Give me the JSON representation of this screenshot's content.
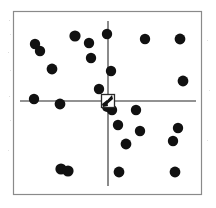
{
  "figure": {
    "title": "",
    "watermark_text": "",
    "background_color": "#ffffff",
    "frame": {
      "x": 13.5,
      "y": 11.5,
      "width": 188,
      "height": 183,
      "stroke_color": "#8a8a8a",
      "stroke_width": 1.2
    },
    "speckle_color": "#d8d8d8"
  },
  "chart_data": {
    "type": "scatter",
    "title": "",
    "subtitle": "",
    "xlabel": "",
    "ylabel": "",
    "xlim": [
      13.5,
      201.5
    ],
    "ylim": [
      11.5,
      194.5
    ],
    "grid": false,
    "legend": null,
    "legend_position": "none",
    "marker_shape": "circle",
    "marker_color": "#111111",
    "marker_radius": 5.0,
    "axes_style": {
      "type": "crosshair",
      "stroke_color": "#6e6e6e",
      "stroke_width": 1.6,
      "origin_x": 108,
      "origin_y": 101,
      "vertical_axis": {
        "x": 108,
        "y_start": 21,
        "y_end": 186
      },
      "horizontal_axis": {
        "y": 101,
        "x_start": 20,
        "x_end": 196
      }
    },
    "origin_marker": {
      "shape": "square-outline-with-blot",
      "x": 108,
      "y": 101,
      "size": 13,
      "stroke_color": "#2a2a2a",
      "stroke_width": 1.3,
      "blot_color": "#111111",
      "label": "origin"
    },
    "points": [
      {
        "x": 35,
        "y": 44,
        "r": 5.2,
        "quadrant": "upper-left"
      },
      {
        "x": 40,
        "y": 51,
        "r": 5.2,
        "quadrant": "upper-left"
      },
      {
        "x": 52,
        "y": 69,
        "r": 5.4,
        "quadrant": "upper-left"
      },
      {
        "x": 75,
        "y": 36,
        "r": 5.6,
        "quadrant": "upper-left"
      },
      {
        "x": 89,
        "y": 43,
        "r": 5.2,
        "quadrant": "upper-left"
      },
      {
        "x": 91,
        "y": 58,
        "r": 5.2,
        "quadrant": "upper-left"
      },
      {
        "x": 34,
        "y": 99,
        "r": 5.2,
        "quadrant": "upper-left"
      },
      {
        "x": 60,
        "y": 104,
        "r": 5.4,
        "quadrant": "lower-left"
      },
      {
        "x": 107,
        "y": 34,
        "r": 5.2,
        "quadrant": "upper-right"
      },
      {
        "x": 111,
        "y": 71,
        "r": 5.2,
        "quadrant": "upper-right"
      },
      {
        "x": 145,
        "y": 39,
        "r": 5.2,
        "quadrant": "upper-right"
      },
      {
        "x": 180,
        "y": 39,
        "r": 5.4,
        "quadrant": "upper-right"
      },
      {
        "x": 183,
        "y": 81,
        "r": 5.4,
        "quadrant": "upper-right"
      },
      {
        "x": 61,
        "y": 169,
        "r": 5.6,
        "quadrant": "lower-left"
      },
      {
        "x": 68,
        "y": 171,
        "r": 5.6,
        "quadrant": "lower-left"
      },
      {
        "x": 112,
        "y": 110,
        "r": 5.2,
        "quadrant": "lower-right"
      },
      {
        "x": 136,
        "y": 110,
        "r": 5.2,
        "quadrant": "lower-right"
      },
      {
        "x": 118,
        "y": 125,
        "r": 5.2,
        "quadrant": "lower-right"
      },
      {
        "x": 140,
        "y": 131,
        "r": 5.2,
        "quadrant": "lower-right"
      },
      {
        "x": 126,
        "y": 144,
        "r": 5.4,
        "quadrant": "lower-right"
      },
      {
        "x": 119,
        "y": 172,
        "r": 5.4,
        "quadrant": "lower-right"
      },
      {
        "x": 178,
        "y": 128,
        "r": 5.2,
        "quadrant": "lower-right"
      },
      {
        "x": 173,
        "y": 141,
        "r": 5.2,
        "quadrant": "lower-right"
      },
      {
        "x": 175,
        "y": 172,
        "r": 5.4,
        "quadrant": "lower-right"
      },
      {
        "x": 107,
        "y": 107,
        "r": 5.0,
        "quadrant": "origin"
      },
      {
        "x": 99,
        "y": 89,
        "r": 5.2,
        "quadrant": "upper-left"
      },
      {
        "x": 194,
        "y": 95,
        "r": 0.0,
        "quadrant": "edge"
      }
    ]
  }
}
